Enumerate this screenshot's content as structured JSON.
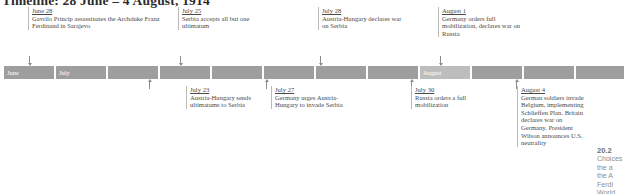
{
  "title": "Timeline: 28 June – 4 August, 1914",
  "bar": {
    "segments": [
      {
        "label": "June",
        "shade": "dark"
      },
      {
        "label": "July",
        "shade": "dark"
      },
      {
        "label": "",
        "shade": "dark"
      },
      {
        "label": "",
        "shade": "dark"
      },
      {
        "label": "",
        "shade": "dark"
      },
      {
        "label": "",
        "shade": "dark"
      },
      {
        "label": "",
        "shade": "dark"
      },
      {
        "label": "",
        "shade": "dark"
      },
      {
        "label": "",
        "shade": "dark"
      },
      {
        "label": "",
        "shade": "dark"
      },
      {
        "label": "",
        "shade": "dark"
      },
      {
        "label": "August",
        "shade": "light"
      },
      {
        "label": "",
        "shade": "dark"
      },
      {
        "label": "",
        "shade": "dark"
      },
      {
        "label": "",
        "shade": "dark"
      }
    ]
  },
  "events_above": [
    {
      "date": "June 28",
      "text": "Gavrilo Princip assassinates the Archduke Franz Ferdinand in Sarajevo"
    },
    {
      "date": "July 25",
      "text": "Serbia accepts all but one ultimatum"
    },
    {
      "date": "July 28",
      "text": "Austria-Hungary declares war on Serbia"
    },
    {
      "date": "August 1",
      "text": "Germany orders full mobilization, declares war on Russia"
    }
  ],
  "events_below": [
    {
      "date": "July 23",
      "text": "Austria-Hungary sends ultimatums to Serbia"
    },
    {
      "date": "July 27",
      "text": "Germany urges Austria-Hungary to invade Serbia"
    },
    {
      "date": "July 30",
      "text": "Russia orders a full mobilization"
    },
    {
      "date": "August 4",
      "text": "German soldiers invade Belgium, implementing Schlieffen Plan. Britain declares war on Germany. President Wilson announces U.S. neutrality"
    }
  ],
  "margin_caption": {
    "number": "20.2",
    "line1": "Choices",
    "line2": "the a",
    "line3": "the A",
    "line4": "Ferdi",
    "line5": "World"
  },
  "colors": {
    "bar_dark": "#9e9e9e",
    "bar_light": "#bdbdbd",
    "text": "#4a4a4a",
    "rule": "#b9b9b9"
  }
}
